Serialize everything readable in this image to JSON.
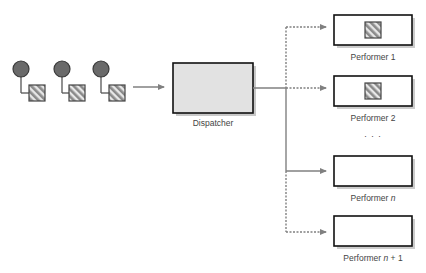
{
  "diagram": {
    "type": "dispatcher-performer-pattern",
    "colors": {
      "line": "#808080",
      "box_border": "#111111",
      "dispatcher_fill": "#e2e2e2",
      "performer_fill": "#ffffff",
      "client_circle": "#6a6a6a",
      "hatch_dark": "#8a8a8a",
      "hatch_light": "#e8e8e8"
    },
    "clients": [
      {
        "icon": "client-with-task-icon"
      },
      {
        "icon": "client-with-task-icon"
      },
      {
        "icon": "client-with-task-icon"
      }
    ],
    "dispatcher": {
      "label": "Dispatcher"
    },
    "performers": [
      {
        "prefix": "Performer ",
        "var": "",
        "suffix": "1",
        "busy": true,
        "connection": "dotted"
      },
      {
        "prefix": "Performer ",
        "var": "",
        "suffix": "2",
        "busy": true,
        "connection": "dotted"
      },
      {
        "prefix": "Performer ",
        "var": "n",
        "suffix": "",
        "busy": false,
        "connection": "solid"
      },
      {
        "prefix": "Performer ",
        "var": "n",
        "suffix": " + 1",
        "busy": false,
        "connection": "dotted"
      }
    ],
    "ellipsis": ". . ."
  }
}
